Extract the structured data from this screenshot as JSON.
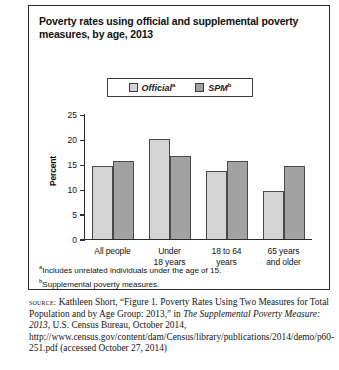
{
  "figure": {
    "title": "Poverty rates using official and supplemental poverty measures, by age, 2013"
  },
  "legend": {
    "items": [
      {
        "label": "Official",
        "marker": "a",
        "swatch": "#d2d2d2",
        "name": "legend-swatch-official"
      },
      {
        "label": "SPM",
        "marker": "b",
        "swatch": "#9f9f9f",
        "name": "legend-swatch-spm"
      }
    ]
  },
  "axes": {
    "ylabel": "Percent",
    "yticks": [
      "0",
      "5",
      "10",
      "15",
      "20",
      "25"
    ]
  },
  "categories": [
    {
      "line1": "All people",
      "line2": ""
    },
    {
      "line1": "Under",
      "line2": "18 years"
    },
    {
      "line1": "18 to 64",
      "line2": "years"
    },
    {
      "line1": "65 years",
      "line2": "and older"
    }
  ],
  "footnotes": [
    {
      "marker": "a",
      "text": "Includes unrelated individuals under the age of 15."
    },
    {
      "marker": "b",
      "text": "Supplemental poverty measures."
    }
  ],
  "source": {
    "label": "source:",
    "part1": " Kathleen Short, “Figure 1. Poverty Rates Using Two Measures for Total Population and by Age Group: 2013,” in ",
    "italic1": "The Supplemental Poverty Measure: 2013",
    "part2": ", U.S. Census Bureau, October 2014, http://www.census.gov/content/dam/Census/library/publications/2014/demo/p60-251.pdf (accessed October 27, 2014)"
  },
  "chart_data": {
    "type": "bar",
    "title": "Poverty rates using official and supplemental poverty measures, by age, 2013",
    "xlabel": "",
    "ylabel": "Percent",
    "ylim": [
      0,
      25
    ],
    "yticks": [
      0,
      5,
      10,
      15,
      20,
      25
    ],
    "grid": false,
    "legend_position": "top-center",
    "categories": [
      "All people",
      "Under 18 years",
      "18 to 64 years",
      "65 years and older"
    ],
    "series": [
      {
        "name": "Official",
        "color": "#d4d4d4",
        "values": [
          14.5,
          20.0,
          13.5,
          9.5
        ]
      },
      {
        "name": "SPM",
        "color": "#a2a2a2",
        "values": [
          15.5,
          16.5,
          15.5,
          14.5
        ]
      }
    ]
  }
}
